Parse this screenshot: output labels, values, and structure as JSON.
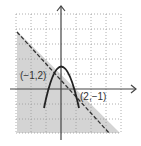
{
  "diagram": {
    "type": "graph-of-system-of-inequalities",
    "unit_px": 15,
    "origin_px": [
      61,
      89
    ],
    "grid": {
      "x_range": [
        -3,
        4
      ],
      "y_range": [
        -3,
        5
      ],
      "style": "dotted"
    },
    "curves": [
      {
        "name": "parabola",
        "style": "solid",
        "equation": "y = 1.5 - 2x^2",
        "x_range": [
          -1.15,
          1.2
        ]
      },
      {
        "name": "boundary-line",
        "style": "dashed",
        "equation": "y = 1 - x",
        "shaded": "below"
      }
    ],
    "points": [
      {
        "label": "(−1,2)",
        "x": -1,
        "y": 2
      },
      {
        "label": "(2,−1)",
        "x": 2,
        "y": -1
      }
    ],
    "colors": {
      "shade": "#d4d4d4",
      "grid": "#9a9a9a",
      "axis": "#444444",
      "curve": "#222222"
    }
  },
  "labels": {
    "point_a": "(−1,2)",
    "point_b": "(2,−1)"
  }
}
